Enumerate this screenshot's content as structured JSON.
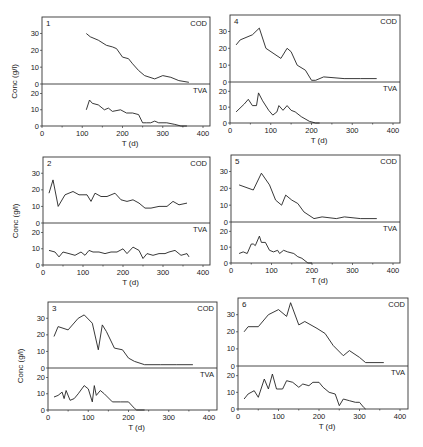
{
  "figure": {
    "ylabel": "Conc (g/l)",
    "xlabel": "T (d)",
    "series_labels": {
      "top": "COD",
      "bottom": "TVA"
    }
  },
  "chart_data": [
    {
      "type": "line",
      "panel": "1",
      "title": "",
      "xlabel": "T (d)",
      "ylabel": "Conc (g/l)",
      "xlim": [
        0,
        400
      ],
      "xticks": [
        0,
        100,
        200,
        300,
        400
      ],
      "top": {
        "name": "COD",
        "ylim": [
          0,
          38
        ],
        "yticks": [
          0,
          10,
          20,
          30
        ],
        "x": [
          110,
          120,
          140,
          160,
          175,
          185,
          200,
          215,
          225,
          240,
          255,
          280,
          300,
          320,
          340,
          365
        ],
        "y": [
          30,
          28,
          26,
          23,
          22,
          21,
          16,
          15,
          12,
          8,
          5,
          3,
          5,
          4,
          2,
          1
        ]
      },
      "bottom": {
        "name": "TVA",
        "ylim": [
          0,
          24
        ],
        "yticks": [
          0,
          10,
          20
        ],
        "x": [
          110,
          118,
          125,
          140,
          155,
          165,
          175,
          195,
          210,
          225,
          240,
          250,
          260,
          270,
          280,
          290,
          310,
          330,
          345,
          360
        ],
        "y": [
          10,
          16,
          14,
          13,
          10,
          11,
          9,
          10,
          8,
          8,
          7,
          2,
          2,
          2,
          3,
          2,
          2,
          1,
          0,
          0
        ]
      },
      "layout": {
        "left": 42,
        "right": 210,
        "top": 17,
        "divider": 84,
        "bottom": 126,
        "x0": 42,
        "x400": 203
      }
    },
    {
      "type": "line",
      "panel": "2",
      "title": "",
      "xlabel": "T (d)",
      "ylabel": "Conc (g/l)",
      "xlim": [
        0,
        400
      ],
      "xticks": [
        0,
        100,
        200,
        300,
        400
      ],
      "top": {
        "name": "COD",
        "ylim": [
          0,
          38
        ],
        "yticks": [
          0,
          10,
          20,
          30
        ],
        "x": [
          15,
          25,
          38,
          55,
          75,
          90,
          110,
          120,
          130,
          145,
          160,
          180,
          195,
          210,
          225,
          240,
          255,
          270,
          290,
          310,
          325,
          340,
          360
        ],
        "y": [
          18,
          26,
          10,
          17,
          19,
          17,
          17,
          13,
          18,
          16,
          16,
          18,
          14,
          13,
          14,
          12,
          9,
          9,
          10,
          10,
          13,
          11,
          12
        ]
      },
      "bottom": {
        "name": "TVA",
        "ylim": [
          0,
          24
        ],
        "yticks": [
          0,
          10,
          20
        ],
        "x": [
          15,
          30,
          40,
          50,
          65,
          80,
          95,
          105,
          115,
          125,
          140,
          155,
          170,
          185,
          200,
          210,
          225,
          240,
          250,
          260,
          275,
          290,
          305,
          315,
          330,
          345,
          360,
          365
        ],
        "y": [
          9,
          8,
          5,
          8,
          7,
          6,
          8,
          6,
          9,
          8,
          8,
          7,
          8,
          8,
          10,
          7,
          11,
          9,
          4,
          7,
          6,
          7,
          7,
          8,
          9,
          6,
          7,
          5
        ]
      },
      "layout": {
        "left": 43,
        "right": 210,
        "top": 157,
        "divider": 223,
        "bottom": 265,
        "x0": 43,
        "x400": 203
      }
    },
    {
      "type": "line",
      "panel": "3",
      "title": "",
      "xlabel": "T (d)",
      "ylabel": "Conc (g/l)",
      "xlim": [
        0,
        400
      ],
      "xticks": [
        0,
        100,
        200,
        300,
        400
      ],
      "top": {
        "name": "COD",
        "ylim": [
          0,
          38
        ],
        "yticks": [
          0,
          10,
          20,
          30
        ],
        "x": [
          15,
          25,
          50,
          75,
          90,
          110,
          125,
          135,
          145,
          165,
          185,
          200,
          215,
          240,
          280,
          320,
          360
        ],
        "y": [
          19,
          25,
          23,
          30,
          32,
          27,
          11,
          26,
          22,
          12,
          11,
          6,
          4,
          2,
          2,
          2,
          2
        ]
      },
      "bottom": {
        "name": "TVA",
        "ylim": [
          0,
          24
        ],
        "yticks": [
          0,
          10,
          20
        ],
        "x": [
          15,
          25,
          35,
          40,
          45,
          55,
          65,
          75,
          90,
          100,
          110,
          115,
          120,
          130,
          140,
          160,
          180,
          200,
          215,
          220,
          240
        ],
        "y": [
          8,
          9,
          11,
          7,
          12,
          6,
          7,
          10,
          15,
          13,
          5,
          15,
          9,
          12,
          10,
          5,
          5,
          5,
          1,
          0,
          0
        ]
      },
      "layout": {
        "left": 48,
        "right": 217,
        "top": 302,
        "divider": 368,
        "bottom": 410,
        "x0": 48,
        "x400": 209
      }
    },
    {
      "type": "line",
      "panel": "4",
      "title": "",
      "xlabel": "T (d)",
      "ylabel": "Conc (g/l)",
      "xlim": [
        0,
        400
      ],
      "xticks": [
        0,
        100,
        200,
        300,
        400
      ],
      "top": {
        "name": "COD",
        "ylim": [
          0,
          38
        ],
        "yticks": [
          0,
          10,
          20,
          30
        ],
        "x": [
          15,
          25,
          55,
          72,
          88,
          125,
          140,
          150,
          165,
          185,
          200,
          210,
          230,
          280,
          320,
          360
        ],
        "y": [
          22,
          25,
          28,
          32,
          20,
          14,
          20,
          18,
          10,
          7,
          1,
          1,
          3,
          2,
          2,
          2
        ]
      },
      "bottom": {
        "name": "TVA",
        "ylim": [
          0,
          24
        ],
        "yticks": [
          0,
          10,
          20
        ],
        "x": [
          15,
          35,
          45,
          55,
          65,
          70,
          80,
          95,
          105,
          115,
          120,
          130,
          140,
          150,
          160,
          175,
          195,
          210,
          220
        ],
        "y": [
          7,
          12,
          15,
          11,
          11,
          19,
          14,
          8,
          5,
          7,
          11,
          8,
          11,
          8,
          7,
          4,
          1,
          0,
          0
        ]
      },
      "layout": {
        "left": 230,
        "right": 400,
        "top": 15,
        "divider": 82,
        "bottom": 123,
        "x0": 230,
        "x400": 393
      }
    },
    {
      "type": "line",
      "panel": "5",
      "title": "",
      "xlabel": "T (d)",
      "ylabel": "Conc (g/l)",
      "xlim": [
        0,
        400
      ],
      "xticks": [
        0,
        100,
        200,
        300,
        400
      ],
      "top": {
        "name": "COD",
        "ylim": [
          0,
          38
        ],
        "yticks": [
          0,
          10,
          20,
          30
        ],
        "x": [
          20,
          55,
          75,
          95,
          110,
          125,
          135,
          150,
          165,
          180,
          205,
          225,
          260,
          280,
          320,
          360
        ],
        "y": [
          22,
          19,
          29,
          22,
          13,
          10,
          16,
          13,
          11,
          6,
          2,
          3,
          2,
          3,
          2,
          2
        ]
      },
      "bottom": {
        "name": "TVA",
        "ylim": [
          0,
          24
        ],
        "yticks": [
          0,
          10,
          20
        ],
        "x": [
          20,
          30,
          40,
          50,
          55,
          60,
          70,
          75,
          85,
          95,
          105,
          115,
          120,
          130,
          140,
          155,
          165,
          175,
          190,
          200
        ],
        "y": [
          6,
          7,
          6,
          12,
          12,
          11,
          17,
          13,
          13,
          8,
          7,
          8,
          6,
          8,
          7,
          6,
          4,
          3,
          0,
          0
        ]
      },
      "layout": {
        "left": 231,
        "right": 400,
        "top": 155,
        "divider": 222,
        "bottom": 263,
        "x0": 231,
        "x400": 393
      }
    },
    {
      "type": "line",
      "panel": "6",
      "title": "",
      "xlabel": "T (d)",
      "ylabel": "Conc (g/l)",
      "xlim": [
        0,
        400
      ],
      "xticks": [
        0,
        100,
        200,
        300,
        400
      ],
      "top": {
        "name": "COD",
        "ylim": [
          0,
          38
        ],
        "yticks": [
          0,
          10,
          20,
          30
        ],
        "x": [
          15,
          25,
          50,
          75,
          100,
          120,
          130,
          150,
          165,
          195,
          215,
          235,
          260,
          275,
          300,
          315,
          360
        ],
        "y": [
          20,
          23,
          23,
          30,
          33,
          29,
          37,
          24,
          26,
          22,
          19,
          12,
          6,
          9,
          5,
          2,
          2
        ]
      },
      "bottom": {
        "name": "TVA",
        "ylim": [
          0,
          24
        ],
        "yticks": [
          0,
          10,
          20
        ],
        "x": [
          15,
          25,
          40,
          50,
          65,
          75,
          85,
          95,
          110,
          120,
          135,
          150,
          160,
          175,
          185,
          200,
          210,
          225,
          240,
          250,
          260,
          275,
          290,
          300,
          310,
          315
        ],
        "y": [
          6,
          9,
          11,
          7,
          18,
          12,
          21,
          12,
          12,
          17,
          16,
          13,
          15,
          14,
          16,
          16,
          13,
          10,
          9,
          2,
          6,
          5,
          4,
          4,
          1,
          0
        ]
      },
      "layout": {
        "left": 238,
        "right": 408,
        "top": 298,
        "divider": 366,
        "bottom": 409,
        "x0": 238,
        "x400": 400
      }
    }
  ]
}
